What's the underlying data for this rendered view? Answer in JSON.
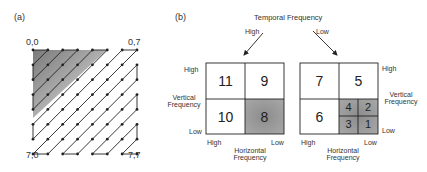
{
  "panel_a": {
    "tag": "(a)",
    "corner_labels": {
      "top_left": "0,0",
      "top_right": "0,7",
      "bottom_left": "7,0",
      "bottom_right": "7,7"
    },
    "grid_size": 8,
    "shaded_region": "upper-left triangle (low frequencies)",
    "scan_pattern": "zigzag"
  },
  "panel_b": {
    "tag": "(b)",
    "temporal_axis": {
      "title": "Temporal Frequency",
      "high_label": "High",
      "low_label": "Low"
    },
    "left_cube": {
      "temporal": "High",
      "cells": {
        "top_left": "11",
        "top_right": "9",
        "bottom_left": "10",
        "bottom_right": "8"
      },
      "shaded": [
        "8"
      ],
      "vertical_axis": {
        "high": "High",
        "title_line1": "Vertical",
        "title_line2": "Frequency",
        "low": "Low"
      },
      "horizontal_axis": {
        "high": "High",
        "low": "Low",
        "title_line1": "Horizontal",
        "title_line2": "Frequency"
      }
    },
    "right_cube": {
      "temporal": "Low",
      "cells": {
        "top_left": "7",
        "top_right": "5",
        "bottom_left": "6",
        "sub": {
          "top_left": "4",
          "top_right": "2",
          "bottom_left": "3",
          "bottom_right": "1"
        }
      },
      "shaded": [
        "4",
        "2",
        "3",
        "1"
      ],
      "vertical_axis": {
        "high": "High",
        "title_line1": "Vertical",
        "title_line2": "Frequency",
        "low": "Low"
      },
      "horizontal_axis": {
        "high": "High",
        "low": "Low",
        "title_line1": "Horizontal",
        "title_line2": "Frequency"
      }
    }
  },
  "colors": {
    "line": "#222222",
    "shade_dark": "#8a8a8a",
    "shade_light": "#c8c8c8"
  }
}
